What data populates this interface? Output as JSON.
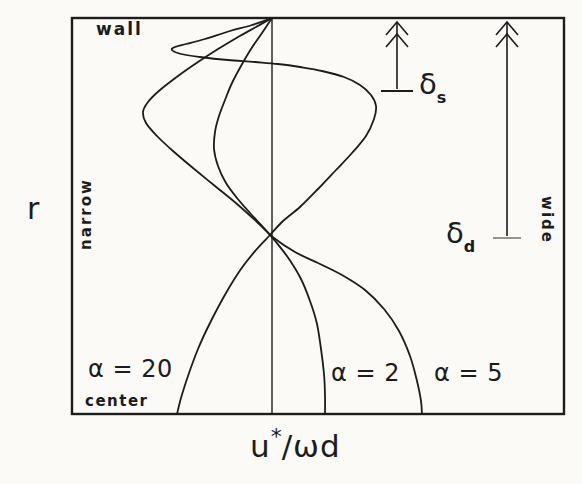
{
  "figure": {
    "wall_label": "wall",
    "center_label": "center",
    "narrow_label": "narrow",
    "wide_label": "wide",
    "r_axis_label": "r",
    "u_axis_label": {
      "base": "u",
      "sup": "*",
      "rest": "/ωd"
    },
    "ink_color": "#1c1c1c",
    "background_color": "#fbfaf6"
  },
  "chart_data": {
    "type": "line",
    "xlabel": "u*/ωd",
    "ylabel": "r",
    "grid": false,
    "legend_position": "labels drawn next to curves near the channel center",
    "region_labels": {
      "top": "wall",
      "bottom": "center",
      "left_side": "narrow",
      "right_side": "wide"
    },
    "layout": {
      "box_px": {
        "left": 72,
        "top": 18,
        "right": 564,
        "bottom": 414
      },
      "axis_x_px": 272,
      "box_stroke_width": 2.4,
      "axis_stroke_width": 1.4,
      "curve_stroke_width": 1.8
    },
    "series": [
      {
        "name": "alpha-20",
        "label": "α = 20",
        "px_points": [
          [
            272,
            18
          ],
          [
            252,
            25
          ],
          [
            230,
            31
          ],
          [
            205,
            39
          ],
          [
            186,
            44
          ],
          [
            175,
            47
          ],
          [
            172,
            50
          ],
          [
            181,
            54
          ],
          [
            200,
            57
          ],
          [
            228,
            60
          ],
          [
            255,
            62
          ],
          [
            278,
            64
          ],
          [
            300,
            67
          ],
          [
            322,
            71
          ],
          [
            344,
            77
          ],
          [
            360,
            85
          ],
          [
            371,
            95
          ],
          [
            376,
            106
          ],
          [
            374,
            119
          ],
          [
            366,
            136
          ],
          [
            352,
            153
          ],
          [
            336,
            170
          ],
          [
            318,
            189
          ],
          [
            300,
            207
          ],
          [
            283,
            221
          ],
          [
            270,
            235
          ],
          [
            256,
            250
          ],
          [
            241,
            269
          ],
          [
            226,
            293
          ],
          [
            211,
            321
          ],
          [
            198,
            349
          ],
          [
            188,
            376
          ],
          [
            181,
            398
          ],
          [
            177,
            414
          ]
        ]
      },
      {
        "name": "alpha-2",
        "label": "α = 2",
        "px_points": [
          [
            272,
            18
          ],
          [
            262,
            33
          ],
          [
            251,
            49
          ],
          [
            241,
            66
          ],
          [
            232,
            83
          ],
          [
            225,
            100
          ],
          [
            219,
            116
          ],
          [
            215,
            132
          ],
          [
            214,
            149
          ],
          [
            218,
            166
          ],
          [
            226,
            183
          ],
          [
            237,
            198
          ],
          [
            250,
            213
          ],
          [
            263,
            227
          ],
          [
            276,
            242
          ],
          [
            289,
            259
          ],
          [
            301,
            279
          ],
          [
            310,
            301
          ],
          [
            317,
            324
          ],
          [
            321,
            349
          ],
          [
            324,
            374
          ],
          [
            325,
            395
          ],
          [
            325,
            414
          ]
        ]
      },
      {
        "name": "alpha-5",
        "label": "α = 5",
        "px_points": [
          [
            272,
            18
          ],
          [
            256,
            27
          ],
          [
            238,
            37
          ],
          [
            218,
            49
          ],
          [
            198,
            62
          ],
          [
            178,
            76
          ],
          [
            160,
            90
          ],
          [
            148,
            102
          ],
          [
            143,
            112
          ],
          [
            146,
            123
          ],
          [
            157,
            136
          ],
          [
            173,
            151
          ],
          [
            193,
            168
          ],
          [
            215,
            186
          ],
          [
            237,
            204
          ],
          [
            257,
            222
          ],
          [
            274,
            238
          ],
          [
            295,
            252
          ],
          [
            318,
            263
          ],
          [
            342,
            275
          ],
          [
            365,
            290
          ],
          [
            384,
            309
          ],
          [
            399,
            331
          ],
          [
            410,
            356
          ],
          [
            417,
            381
          ],
          [
            421,
            401
          ],
          [
            422,
            414
          ]
        ]
      }
    ],
    "annotations": [
      {
        "name": "delta-s",
        "label_base": "δ",
        "label_sub": "s",
        "meaning": "Stokes-layer thickness measured down from the wall",
        "arrow_x_px": 397,
        "arrow_top_px": 22,
        "arrow_bottom_px": 91,
        "tick_half_width_px": 16,
        "tick_color": "#1c1c1c"
      },
      {
        "name": "delta-d",
        "label_base": "δ",
        "label_sub": "d",
        "meaning": "deep (wide-gap) boundary-layer thickness measured down from the wall",
        "arrow_x_px": 507,
        "arrow_top_px": 22,
        "arrow_bottom_px": 238,
        "tick_half_width_px": 14,
        "tick_color": "#98948c"
      }
    ]
  }
}
